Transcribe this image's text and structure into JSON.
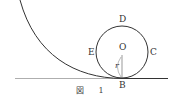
{
  "figure": {
    "caption": "図 1",
    "labels": {
      "D": "D",
      "E": "E",
      "C": "C",
      "O": "O",
      "B": "B",
      "r": "r"
    },
    "colors": {
      "stroke": "#333333",
      "ground": "#888888",
      "background": "#ffffff"
    }
  }
}
